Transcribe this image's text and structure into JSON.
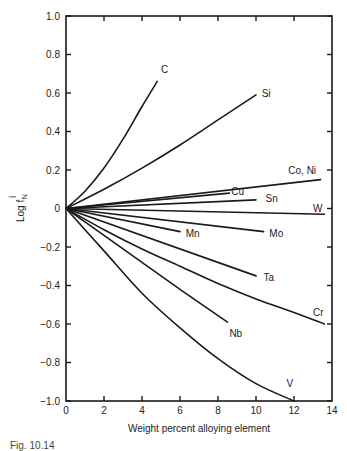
{
  "chart_data": {
    "type": "line",
    "title": "",
    "xlabel": "Weight percent alloying element",
    "ylabel": "Log f^i_N",
    "ylabel_main": "Log f",
    "ylabel_sup": "i",
    "ylabel_sub": "N",
    "xlim": [
      0,
      14
    ],
    "ylim": [
      -1.0,
      1.0
    ],
    "xticks": [
      0,
      2,
      4,
      6,
      8,
      10,
      12,
      14
    ],
    "xtick_labels": [
      "0",
      "2",
      "4",
      "6",
      "8",
      "10",
      "12",
      "14"
    ],
    "yticks": [
      1.0,
      0.8,
      0.6,
      0.4,
      0.2,
      0,
      -0.2,
      -0.4,
      -0.6,
      -0.8,
      -1.0
    ],
    "ytick_labels": [
      "1.0",
      "0.8",
      "0.6",
      "0.4",
      "0.2",
      "0",
      "−0.2",
      "−0.4",
      "−0.6",
      "−0.8",
      "−1.0"
    ],
    "grid": false,
    "legend": "inline curve labels",
    "series": [
      {
        "name": "C",
        "x": [
          0,
          1,
          2,
          3,
          4,
          4.8
        ],
        "y": [
          0,
          0.09,
          0.21,
          0.36,
          0.53,
          0.66
        ],
        "label_pos": [
          5.0,
          0.72
        ]
      },
      {
        "name": "Si",
        "x": [
          0,
          2,
          4,
          6,
          8,
          10
        ],
        "y": [
          0,
          0.1,
          0.21,
          0.33,
          0.46,
          0.59
        ],
        "label_pos": [
          10.3,
          0.6
        ]
      },
      {
        "name": "Co, Ni",
        "x": [
          0,
          13.4
        ],
        "y": [
          0,
          0.15
        ],
        "label_pos": [
          11.7,
          0.2
        ]
      },
      {
        "name": "Cu",
        "x": [
          0,
          8.6
        ],
        "y": [
          0,
          0.08
        ],
        "label_pos": [
          8.7,
          0.09
        ]
      },
      {
        "name": "Sn",
        "x": [
          0,
          10.0
        ],
        "y": [
          0,
          0.045
        ],
        "label_pos": [
          10.5,
          0.05
        ]
      },
      {
        "name": "W",
        "x": [
          0,
          13.6
        ],
        "y": [
          0,
          -0.03
        ],
        "label_pos": [
          13.0,
          0.0
        ]
      },
      {
        "name": "Mn",
        "x": [
          0,
          6.0
        ],
        "y": [
          0,
          -0.12
        ],
        "label_pos": [
          6.3,
          -0.13
        ]
      },
      {
        "name": "Mo",
        "x": [
          0,
          10.4
        ],
        "y": [
          0,
          -0.12
        ],
        "label_pos": [
          10.7,
          -0.13
        ]
      },
      {
        "name": "Ta",
        "x": [
          0,
          10.0
        ],
        "y": [
          0,
          -0.35
        ],
        "label_pos": [
          10.4,
          -0.36
        ]
      },
      {
        "name": "Cr",
        "x": [
          0,
          2,
          4,
          6,
          8,
          10,
          12,
          13.6
        ],
        "y": [
          0,
          -0.11,
          -0.21,
          -0.3,
          -0.39,
          -0.47,
          -0.54,
          -0.6
        ],
        "label_pos": [
          13.0,
          -0.54
        ]
      },
      {
        "name": "Nb",
        "x": [
          0,
          2,
          4,
          6,
          8.5
        ],
        "y": [
          0,
          -0.14,
          -0.28,
          -0.42,
          -0.59
        ],
        "label_pos": [
          8.6,
          -0.65
        ]
      },
      {
        "name": "V",
        "x": [
          0,
          2,
          4,
          6,
          8,
          10,
          12
        ],
        "y": [
          0,
          -0.22,
          -0.44,
          -0.62,
          -0.78,
          -0.91,
          -1.0
        ],
        "label_pos": [
          11.6,
          -0.91
        ]
      }
    ]
  },
  "caption": "Fig. 10.14"
}
